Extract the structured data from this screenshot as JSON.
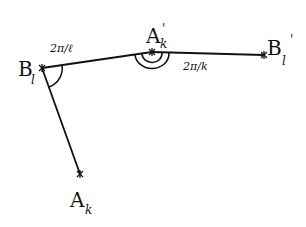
{
  "diagram": {
    "points": [
      {
        "id": "B_l",
        "label": "B",
        "subscript": "l",
        "superscript": "",
        "x": 42,
        "y": 68
      },
      {
        "id": "A_k_prime",
        "label": "A",
        "subscript": "k",
        "superscript": "'",
        "x": 152,
        "y": 52
      },
      {
        "id": "B_l_prime",
        "label": "B",
        "subscript": "l",
        "superscript": "'",
        "x": 264,
        "y": 55
      },
      {
        "id": "A_k",
        "label": "A",
        "subscript": "k",
        "superscript": "",
        "x": 80,
        "y": 174
      }
    ],
    "segments": [
      {
        "from": "B_l",
        "to": "A_k_prime"
      },
      {
        "from": "A_k_prime",
        "to": "B_l_prime"
      },
      {
        "from": "B_l",
        "to": "A_k"
      }
    ],
    "angle_labels": {
      "at_B_l": "2π/ℓ",
      "at_A_k_prime": "2π/k"
    },
    "stroke_color": "#111111"
  }
}
